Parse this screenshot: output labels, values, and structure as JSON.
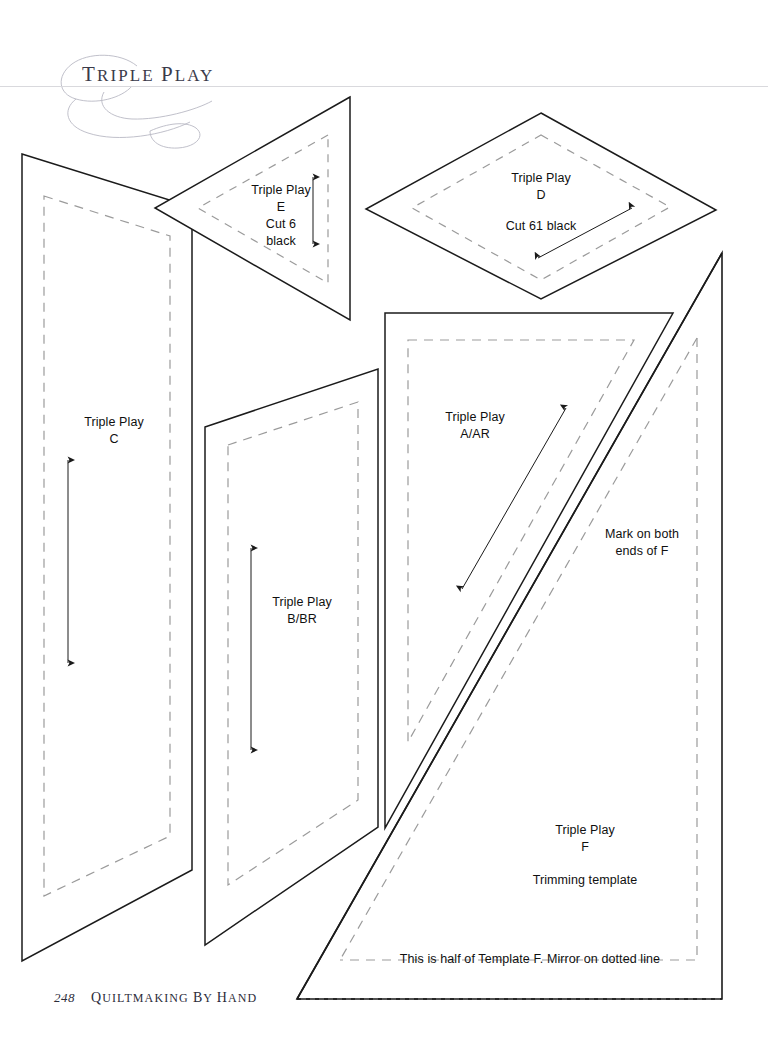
{
  "page": {
    "header_title": "Triple Play",
    "footer_page_number": "248",
    "footer_book_title": "Quiltmaking by Hand",
    "background_color": "#ffffff",
    "ink_color": "#101010",
    "cut_line_color": "#1b1b1b",
    "seam_line_color": "#9b9b9b",
    "header_rule_color": "#d9d9dd"
  },
  "templates": [
    {
      "id": "C",
      "pattern": "Triple Play",
      "letter": "C",
      "label_x": 114,
      "label_y": 414,
      "grainline": "vertical double-headed arrow"
    },
    {
      "id": "E",
      "pattern": "Triple Play",
      "letter": "E",
      "cut_instruction": "Cut 6",
      "fabric": "black",
      "label_x": 281,
      "label_y": 182,
      "grainline": "vertical double-headed arrow"
    },
    {
      "id": "D",
      "pattern": "Triple Play",
      "letter": "D",
      "cut_instruction": "Cut 61 black",
      "label_x": 541,
      "label_y": 170,
      "grainline": "diagonal double-headed arrow"
    },
    {
      "id": "B/BR",
      "pattern": "Triple Play",
      "letter": "B/BR",
      "label_x": 302,
      "label_y": 594,
      "grainline": "vertical double-headed arrow"
    },
    {
      "id": "A/AR",
      "pattern": "Triple Play",
      "letter": "A/AR",
      "label_x": 475,
      "label_y": 409,
      "grainline": "diagonal double-headed arrow"
    },
    {
      "id": "F",
      "pattern": "Triple Play",
      "letter": "F",
      "subtitle": "Trimming template",
      "label_x": 585,
      "label_y": 822,
      "notes": [
        "Mark on both ends of F",
        "This is half of Template F.  Mirror on dotted line"
      ]
    }
  ],
  "annotations": {
    "mark_note_line1": "Mark on both",
    "mark_note_line2": "ends of F",
    "mark_note_x": 642,
    "mark_note_y": 526,
    "mirror_note": "This is half of Template F.  Mirror on dotted line",
    "mirror_note_x": 530,
    "mirror_note_y": 951,
    "trimming_label": "Trimming template"
  }
}
